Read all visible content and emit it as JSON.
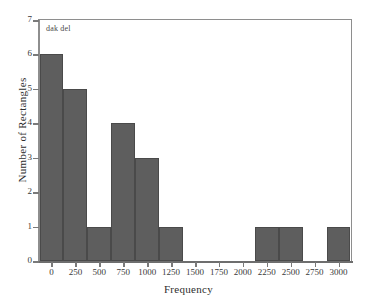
{
  "chart_data": {
    "type": "bar",
    "title": "",
    "annotation": "dak del",
    "xlabel": "Frequency",
    "ylabel": "Number of Rectangles",
    "grid": false,
    "legend": null,
    "bin_width": 250,
    "categories": [
      "0",
      "250",
      "500",
      "750",
      "1000",
      "1250",
      "1500",
      "1750",
      "2000",
      "2250",
      "2500",
      "2750",
      "3000"
    ],
    "values": [
      6,
      5,
      1,
      4,
      3,
      1,
      0,
      0,
      0,
      1,
      1,
      0,
      1
    ],
    "x_ticks": [
      "0",
      "250",
      "500",
      "750",
      "1000",
      "1250",
      "1500",
      "1750",
      "2000",
      "2250",
      "2500",
      "2750",
      "3000"
    ],
    "y_ticks": [
      "0",
      "1",
      "2",
      "3",
      "4",
      "5",
      "6",
      "7"
    ],
    "xlim": [
      -125,
      3125
    ],
    "ylim": [
      0,
      7
    ],
    "bar_color": "#5e5e5e",
    "bar_edge_color": "#4a4a4a",
    "axis_color": "#8e8e8e",
    "text_color": "#2e2e2e"
  }
}
